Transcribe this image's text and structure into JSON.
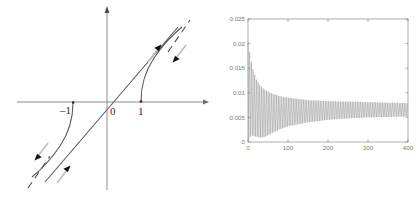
{
  "figure_left": {
    "name": "phase-portrait-diagram",
    "axis_labels": {
      "minus_one": "–1",
      "origin": "0",
      "one": "1"
    },
    "colors": {
      "axis": "#8c8c8c",
      "curve": "#4a4a4a",
      "arrow": "#1a1a1a",
      "arrow_tail": "#b8b8b8"
    },
    "elements": {
      "x_axis": "horizontal-axis-with-arrow",
      "y_axis": "vertical-axis-with-arrow",
      "center_line": "straight-line-through-origin",
      "branch_right": "curve-from-point-one",
      "branch_left": "curve-from-point-minus-one",
      "asymptote_upper": "dashed-asymptote-upper-right",
      "asymptote_lower": "dashed-asymptote-lower-left",
      "arrow_up_inner": "arrow-up-left-on-inner-curve",
      "arrow_down_outer": "arrow-down-right-on-dashed-line",
      "arrow_down_inner": "arrow-down-left-on-dashed-line",
      "arrow_up_outer": "arrow-up-right-on-curve"
    }
  },
  "chart_data": {
    "type": "line",
    "title": "",
    "xlabel": "",
    "ylabel": "",
    "xlim": [
      0,
      400
    ],
    "ylim": [
      0,
      0.025
    ],
    "grid": false,
    "legend": null,
    "box": true,
    "line_color": "#8f8f8f",
    "xticks": [
      0,
      100,
      200,
      300,
      400
    ],
    "xtick_labels": [
      "0",
      "100",
      "200",
      "300",
      "400"
    ],
    "yticks": [
      0,
      0.005,
      0.01,
      0.015,
      0.02,
      0.025
    ],
    "ytick_labels": [
      "0",
      "0.005",
      "0.01",
      "0.015",
      "0.02",
      "0.025"
    ],
    "envelope": {
      "x": [
        0,
        5,
        10,
        20,
        30,
        40,
        60,
        80,
        100,
        150,
        200,
        250,
        300,
        350,
        400
      ],
      "upper": [
        0.0205,
        0.0178,
        0.0155,
        0.0128,
        0.0115,
        0.0107,
        0.0098,
        0.0093,
        0.009,
        0.0085,
        0.0083,
        0.0082,
        0.0081,
        0.008,
        0.0079
      ],
      "lower": [
        0.0,
        0.001,
        0.0013,
        0.0011,
        0.0009,
        0.001,
        0.0018,
        0.0026,
        0.0032,
        0.004,
        0.0045,
        0.0048,
        0.005,
        0.0051,
        0.0052
      ],
      "mean": [
        0.0102,
        0.0094,
        0.0084,
        0.007,
        0.0062,
        0.0059,
        0.0058,
        0.006,
        0.0061,
        0.0063,
        0.0064,
        0.0065,
        0.0066,
        0.0066,
        0.0066
      ]
    },
    "oscillation_period": 4.2
  }
}
